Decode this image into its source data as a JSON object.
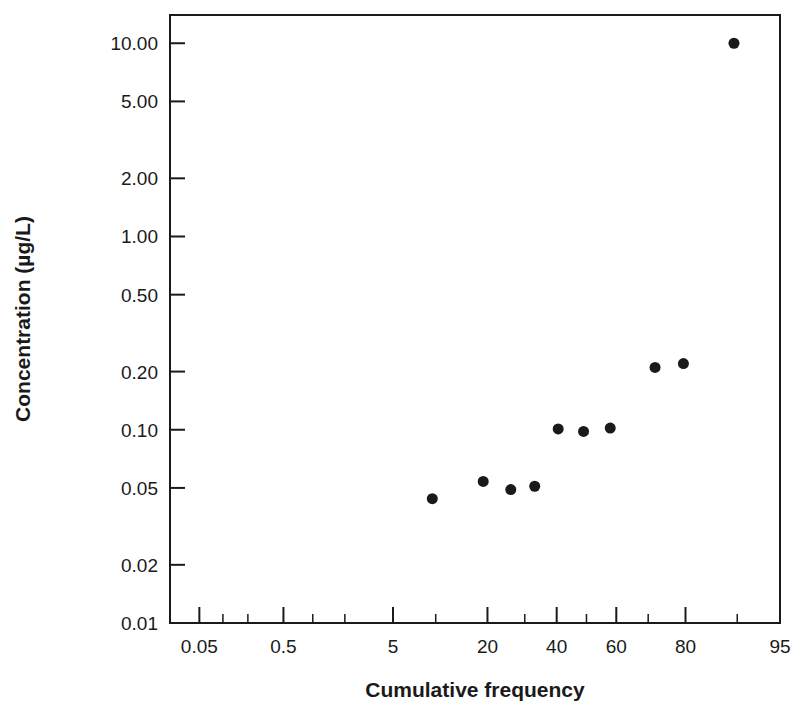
{
  "chart_data": {
    "type": "scatter",
    "title": "",
    "xlabel": "Cumulative frequency",
    "ylabel": "Concentration (µg/L)",
    "x_scale": "probability",
    "y_scale": "log",
    "xlim": [
      0.02,
      95
    ],
    "ylim": [
      0.01,
      14
    ],
    "grid": false,
    "legend": null,
    "x_tick_labels": [
      "0.05",
      "0.5",
      "5",
      "20",
      "40",
      "60",
      "80",
      "95"
    ],
    "x_tick_values": [
      0.05,
      0.5,
      5,
      20,
      40,
      60,
      80,
      95
    ],
    "x_minor_tick_values": [
      0.1,
      0.2,
      1,
      2,
      10,
      30,
      50,
      70,
      90
    ],
    "y_tick_labels": [
      "0.01",
      "0.02",
      "0.05",
      "0.10",
      "0.20",
      "0.50",
      "1.00",
      "2.00",
      "5.00",
      "10.00"
    ],
    "y_tick_values": [
      0.01,
      0.02,
      0.05,
      0.1,
      0.2,
      0.5,
      1.0,
      2.0,
      5.0,
      10.0
    ],
    "points": [
      {
        "x": 9.5,
        "y": 0.044
      },
      {
        "x": 19.0,
        "y": 0.054
      },
      {
        "x": 26.0,
        "y": 0.049
      },
      {
        "x": 33.0,
        "y": 0.051
      },
      {
        "x": 40.5,
        "y": 0.101
      },
      {
        "x": 49.0,
        "y": 0.098
      },
      {
        "x": 58.0,
        "y": 0.102
      },
      {
        "x": 72.0,
        "y": 0.21
      },
      {
        "x": 79.5,
        "y": 0.22
      },
      {
        "x": 89.5,
        "y": 10.0
      }
    ],
    "marker": {
      "shape": "circle",
      "radius": 5.5,
      "color": "#1a1a1a"
    }
  },
  "figure": {
    "background": "#ffffff",
    "axis_color": "#1a1a1a"
  }
}
